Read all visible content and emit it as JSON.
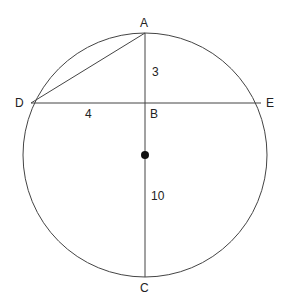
{
  "diagram": {
    "points": {
      "A": {
        "label": "A",
        "x": 145,
        "y": 33
      },
      "B": {
        "label": "B",
        "x": 145,
        "y": 103
      },
      "C": {
        "label": "C",
        "x": 145,
        "y": 277
      },
      "D": {
        "label": "D",
        "x": 31,
        "y": 103
      },
      "E": {
        "label": "E",
        "x": 262,
        "y": 103
      },
      "O": {
        "label": "",
        "x": 145,
        "y": 155
      }
    },
    "segments": [
      "AC",
      "DE",
      "AD"
    ],
    "lengths": {
      "AB": "3",
      "DB": "4",
      "BC": "10"
    },
    "circle": {
      "cx": 145,
      "cy": 155,
      "r": 122
    },
    "stroke_color": "#333333"
  }
}
